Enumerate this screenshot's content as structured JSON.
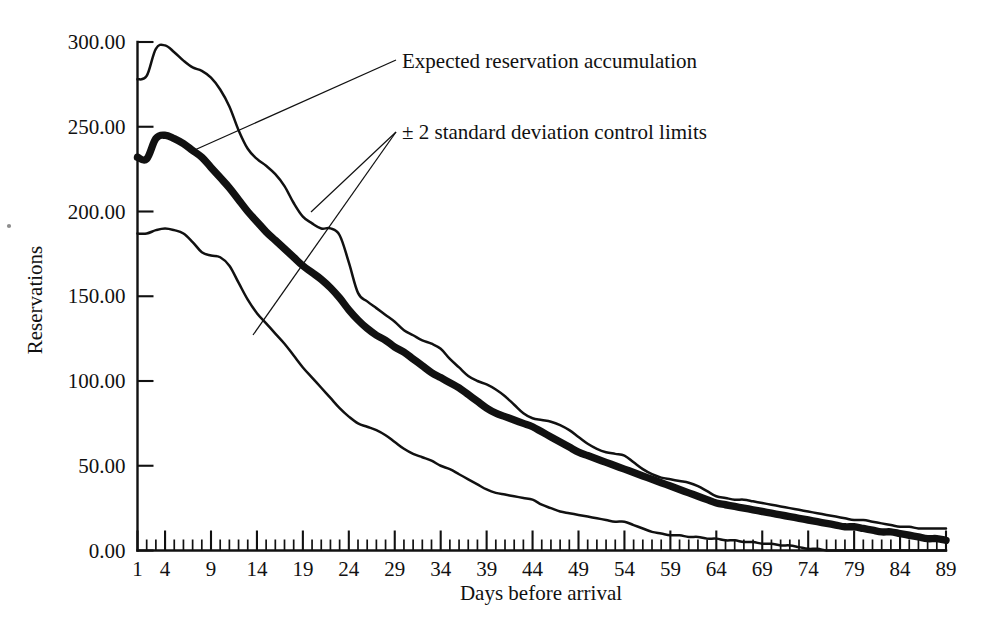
{
  "chart_data": {
    "type": "line",
    "title": "",
    "xlabel": "Days before arrival",
    "ylabel": "Reservations",
    "xlim": [
      1,
      89
    ],
    "ylim": [
      0,
      300
    ],
    "ytick_labels": [
      "0.00",
      "50.00",
      "100.00",
      "150.00",
      "200.00",
      "250.00",
      "300.00"
    ],
    "ytick_values": [
      0,
      50,
      100,
      150,
      200,
      250,
      300
    ],
    "xtick_labels": [
      "1",
      "4",
      "9",
      "14",
      "19",
      "24",
      "29",
      "34",
      "39",
      "44",
      "49",
      "54",
      "59",
      "64",
      "69",
      "74",
      "79",
      "84",
      "89"
    ],
    "xtick_values": [
      1,
      4,
      9,
      14,
      19,
      24,
      29,
      34,
      39,
      44,
      49,
      54,
      59,
      64,
      69,
      74,
      79,
      84,
      89
    ],
    "grid": false,
    "legend_position": "inline-annotations",
    "x": [
      1,
      2,
      3,
      4,
      5,
      6,
      7,
      8,
      9,
      10,
      11,
      12,
      13,
      14,
      15,
      16,
      17,
      18,
      19,
      20,
      21,
      22,
      23,
      24,
      25,
      26,
      27,
      28,
      29,
      30,
      31,
      32,
      33,
      34,
      35,
      36,
      37,
      38,
      39,
      40,
      41,
      42,
      43,
      44,
      45,
      46,
      47,
      48,
      49,
      50,
      51,
      52,
      53,
      54,
      55,
      56,
      57,
      58,
      59,
      60,
      61,
      62,
      63,
      64,
      65,
      66,
      67,
      68,
      69,
      70,
      71,
      72,
      73,
      74,
      75,
      76,
      77,
      78,
      79,
      80,
      81,
      82,
      83,
      84,
      85,
      86,
      87,
      88,
      89
    ],
    "series": [
      {
        "name": "+2 standard deviation control limit",
        "style": "thin",
        "values": [
          278,
          280,
          296,
          298,
          294,
          289,
          285,
          283,
          279,
          272,
          262,
          248,
          237,
          231,
          227,
          222,
          215,
          205,
          197,
          193,
          190,
          190,
          186,
          170,
          152,
          147,
          143,
          139,
          135,
          130,
          127,
          124,
          122,
          119,
          113,
          108,
          103,
          100,
          98,
          95,
          91,
          86,
          81,
          78,
          77,
          76,
          74,
          71,
          67,
          63,
          60,
          58,
          57,
          56,
          52,
          48,
          45,
          43,
          42,
          41,
          40,
          38,
          35,
          32,
          31,
          30,
          30,
          29,
          28,
          27,
          26,
          25,
          24,
          23,
          22,
          21,
          20,
          19,
          18,
          18,
          17,
          16,
          15,
          14,
          14,
          13,
          13,
          13,
          13
        ]
      },
      {
        "name": "Expected reservation accumulation",
        "style": "thick",
        "values": [
          232,
          231,
          243,
          245,
          243,
          240,
          236,
          232,
          226,
          220,
          214,
          207,
          200,
          194,
          188,
          183,
          178,
          173,
          168,
          164,
          160,
          155,
          149,
          142,
          136,
          131,
          127,
          124,
          120,
          117,
          113,
          109,
          105,
          102,
          99,
          96,
          92,
          88,
          84,
          81,
          79,
          77,
          75,
          73,
          70,
          67,
          64,
          61,
          58,
          56,
          54,
          52,
          50,
          48,
          46,
          44,
          42,
          40,
          38,
          36,
          34,
          32,
          30,
          28,
          27,
          26,
          25,
          24,
          23,
          22,
          21,
          20,
          19,
          18,
          17,
          16,
          15,
          14,
          14,
          13,
          12,
          11,
          11,
          10,
          9,
          8,
          7,
          7,
          6
        ]
      },
      {
        "name": "-2 standard deviation control limit",
        "style": "thin",
        "values": [
          187,
          187,
          189,
          190,
          189,
          187,
          182,
          176,
          174,
          173,
          168,
          158,
          148,
          140,
          134,
          128,
          122,
          115,
          108,
          102,
          96,
          90,
          84,
          79,
          75,
          73,
          71,
          68,
          64,
          60,
          57,
          55,
          53,
          50,
          48,
          45,
          42,
          39,
          36,
          34,
          33,
          32,
          31,
          30,
          27,
          25,
          23,
          22,
          21,
          20,
          19,
          18,
          17,
          17,
          15,
          13,
          11,
          10,
          9,
          9,
          8,
          8,
          7,
          7,
          6,
          6,
          5,
          5,
          4,
          4,
          3,
          3,
          2,
          1,
          1,
          0,
          0,
          0,
          0,
          0,
          0,
          0,
          0,
          0,
          0,
          0,
          0,
          0,
          0
        ]
      }
    ],
    "annotations": [
      {
        "text": "Expected reservation accumulation",
        "target": "expected reservation accumulation curve"
      },
      {
        "text": "± 2 standard deviation control limits",
        "target": "upper and lower control limit curves"
      }
    ]
  }
}
